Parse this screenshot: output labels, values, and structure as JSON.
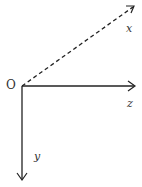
{
  "diagram": {
    "type": "coordinate-axes",
    "origin": {
      "label": "O",
      "x": 22,
      "y": 86
    },
    "axes": [
      {
        "name": "x",
        "label": "x",
        "style": "dashed",
        "direction": "up-right",
        "end": {
          "x": 134,
          "y": 6
        }
      },
      {
        "name": "z",
        "label": "z",
        "style": "solid",
        "direction": "right",
        "end": {
          "x": 135,
          "y": 86
        }
      },
      {
        "name": "y",
        "label": "y",
        "style": "solid",
        "direction": "down",
        "end": {
          "x": 22,
          "y": 180
        }
      }
    ],
    "colors": {
      "stroke": "#222222",
      "label": "#333333",
      "background": "#ffffff"
    }
  }
}
